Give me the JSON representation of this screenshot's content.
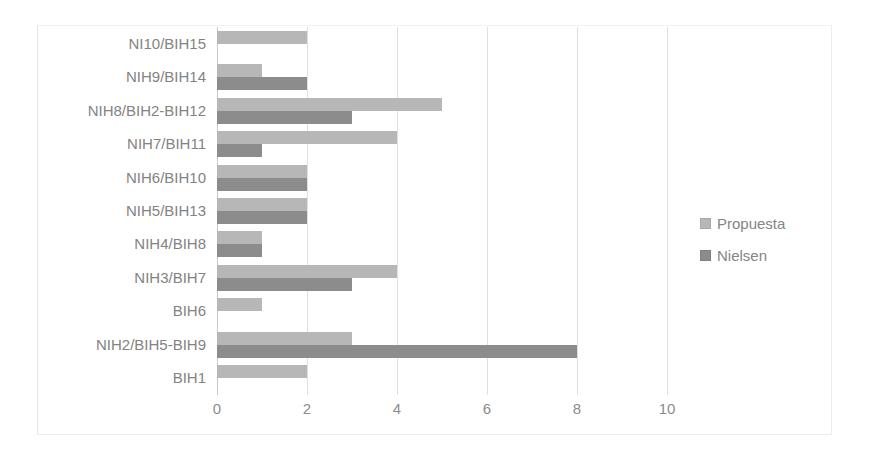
{
  "chart_data": {
    "type": "bar",
    "orientation": "horizontal",
    "title": "",
    "xlabel": "",
    "ylabel": "",
    "xlim": [
      0,
      10
    ],
    "xticks": [
      0,
      2,
      4,
      6,
      8,
      10
    ],
    "grid": true,
    "legend_position": "right",
    "categories": [
      "NI10/BIH15",
      "NIH9/BIH14",
      "NIH8/BIH2-BIH12",
      "NIH7/BIH11",
      "NIH6/BIH10",
      "NIH5/BIH13",
      "NIH4/BIH8",
      "NIH3/BIH7",
      "BIH6",
      "NIH2/BIH5-BIH9",
      "BIH1"
    ],
    "series": [
      {
        "name": "Propuesta",
        "color": "#b7b7b7",
        "values": [
          2,
          1,
          5,
          4,
          2,
          2,
          1,
          4,
          1,
          3,
          2
        ]
      },
      {
        "name": "Nielsen",
        "color": "#8c8c8c",
        "values": [
          0,
          2,
          3,
          1,
          2,
          2,
          1,
          3,
          0,
          8,
          0
        ]
      }
    ]
  },
  "axis": {
    "tick_labels": [
      "0",
      "2",
      "4",
      "6",
      "8",
      "10"
    ]
  },
  "legend": {
    "items": [
      {
        "label": "Propuesta",
        "color": "#b7b7b7"
      },
      {
        "label": "Nielsen",
        "color": "#8c8c8c"
      }
    ]
  }
}
